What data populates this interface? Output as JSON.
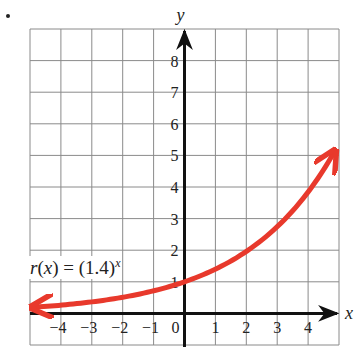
{
  "chart_data": {
    "type": "line",
    "title": "",
    "function_label": {
      "name": "r",
      "var": "x",
      "base": "(1.4)",
      "exponent": "x",
      "text": "r(x) = (1.4)^x"
    },
    "xlabel": "x",
    "ylabel": "y",
    "xlim": [
      -5,
      5
    ],
    "ylim": [
      -1,
      9
    ],
    "grid": true,
    "x_ticks": [
      "-4",
      "-3",
      "-2",
      "-1",
      "0",
      "1",
      "2",
      "3",
      "4"
    ],
    "y_ticks": [
      "1",
      "2",
      "3",
      "4",
      "5",
      "6",
      "7",
      "8"
    ],
    "series": [
      {
        "name": "r(x) = (1.4)^x",
        "color": "#e8392c",
        "x": [
          -4.8,
          -4,
          -3,
          -2,
          -1,
          0,
          1,
          2,
          3,
          4,
          4.8
        ],
        "y": [
          0.2,
          0.26,
          0.36,
          0.51,
          0.71,
          1.0,
          1.4,
          1.96,
          2.74,
          3.84,
          5.03
        ],
        "arrows": "both"
      }
    ]
  },
  "labels": {
    "x_axis": "x",
    "y_axis": "y",
    "fn_name": "r",
    "fn_paren_open": "(",
    "fn_var": "x",
    "fn_paren_close": ")",
    "fn_equals": " = ",
    "fn_base": "(1.4)",
    "fn_exp": "x"
  }
}
